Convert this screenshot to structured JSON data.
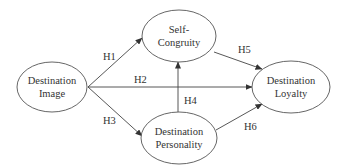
{
  "diagram": {
    "type": "path-model",
    "nodes": [
      {
        "id": "image",
        "lines": [
          "Destination",
          "Image"
        ]
      },
      {
        "id": "congruity",
        "lines": [
          "Self-",
          "Congruity"
        ]
      },
      {
        "id": "personality",
        "lines": [
          "Destination",
          "Personality"
        ]
      },
      {
        "id": "loyalty",
        "lines": [
          "Destination",
          "Loyalty"
        ]
      }
    ],
    "edges": [
      {
        "label": "H1",
        "from": "image",
        "to": "congruity"
      },
      {
        "label": "H2",
        "from": "image",
        "to": "loyalty"
      },
      {
        "label": "H3",
        "from": "image",
        "to": "personality"
      },
      {
        "label": "H4",
        "from": "personality",
        "to": "congruity"
      },
      {
        "label": "H5",
        "from": "congruity",
        "to": "loyalty"
      },
      {
        "label": "H6",
        "from": "personality",
        "to": "loyalty"
      }
    ]
  }
}
